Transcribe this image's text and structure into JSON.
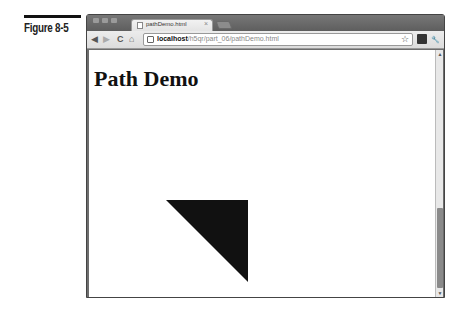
{
  "figure": {
    "label": "Figure 8-5"
  },
  "browser": {
    "tab": {
      "title": "pathDemo.html",
      "close": "×"
    },
    "url": {
      "host": "localhost",
      "path": "/h5qr/part_06/pathDemo.html"
    },
    "icons": {
      "back": "◀",
      "forward": "▶",
      "reload": "C",
      "home": "⌂",
      "star": "☆",
      "wrench": "🔧"
    }
  },
  "page": {
    "title": "Path Demo",
    "shape": {
      "type": "triangle",
      "fill": "#111111",
      "points": [
        [
          77,
          150
        ],
        [
          159,
          150
        ],
        [
          159,
          232
        ]
      ]
    }
  },
  "scrollbar": {
    "up": "▲",
    "down": "▼"
  }
}
